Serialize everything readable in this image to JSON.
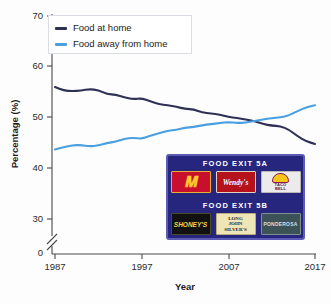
{
  "chart_data": {
    "type": "line",
    "title": "",
    "xlabel": "Year",
    "ylabel": "Percentage (%)",
    "xlim": [
      1987,
      2017
    ],
    "ylim": [
      30,
      70
    ],
    "y_axis_break": true,
    "y_break_from": 0,
    "y_break_to": 30,
    "yticks": [
      30,
      40,
      50,
      60,
      70
    ],
    "ytick_labels": [
      "30",
      "40",
      "50",
      "60",
      "70"
    ],
    "zero_tick_label": "0",
    "xticks": [
      1987,
      1997,
      2007,
      2017
    ],
    "xtick_labels": [
      "1987",
      "1997",
      "2007",
      "2017"
    ],
    "grid": false,
    "legend_position": "top-left",
    "x": [
      1987,
      1988,
      1989,
      1990,
      1991,
      1992,
      1993,
      1994,
      1995,
      1996,
      1997,
      1998,
      1999,
      2000,
      2001,
      2002,
      2003,
      2004,
      2005,
      2006,
      2007,
      2008,
      2009,
      2010,
      2011,
      2012,
      2013,
      2014,
      2015,
      2016,
      2017
    ],
    "series": [
      {
        "name": "Food at home",
        "color": "#2e3054",
        "values": [
          56.0,
          55.3,
          55.2,
          55.3,
          55.6,
          55.4,
          54.6,
          54.5,
          54.0,
          53.6,
          53.8,
          53.2,
          52.6,
          52.4,
          52.1,
          51.7,
          51.6,
          51.0,
          50.8,
          50.6,
          50.1,
          49.9,
          49.6,
          49.3,
          48.7,
          48.4,
          48.3,
          47.6,
          46.3,
          45.3,
          44.8
        ]
      },
      {
        "name": "Food away from home",
        "color": "#4a9fe0",
        "values": [
          43.7,
          44.2,
          44.5,
          44.6,
          44.3,
          44.5,
          45.0,
          45.2,
          45.8,
          46.0,
          45.8,
          46.4,
          46.9,
          47.4,
          47.6,
          48.0,
          48.1,
          48.5,
          48.7,
          48.9,
          49.1,
          48.9,
          49.0,
          49.3,
          49.6,
          49.9,
          50.0,
          50.4,
          51.3,
          52.0,
          52.4
        ]
      }
    ]
  },
  "legend": {
    "items": [
      {
        "label": "Food at home",
        "color": "#2e3054"
      },
      {
        "label": "Food away from home",
        "color": "#4a9fe0"
      }
    ]
  },
  "axes": {
    "y_title": "Percentage (%)",
    "x_title": "Year"
  },
  "inset_sign": {
    "sections": [
      {
        "heading": "FOOD EXIT 5A",
        "logos": [
          {
            "name": "mcdonalds",
            "glyph": "M",
            "sub": "McDonald's"
          },
          {
            "name": "wendys",
            "text": "Wendy's"
          },
          {
            "name": "taco-bell",
            "line1": "TACO",
            "line2": "BELL"
          }
        ]
      },
      {
        "heading": "FOOD EXIT 5B",
        "logos": [
          {
            "name": "shoneys",
            "text": "SHONEY'S"
          },
          {
            "name": "long-john-silvers",
            "line1": "LONG",
            "line2": "JOHN",
            "line3": "SILVER'S"
          },
          {
            "name": "ponderosa",
            "text": "PONDEROSA"
          }
        ]
      }
    ]
  }
}
